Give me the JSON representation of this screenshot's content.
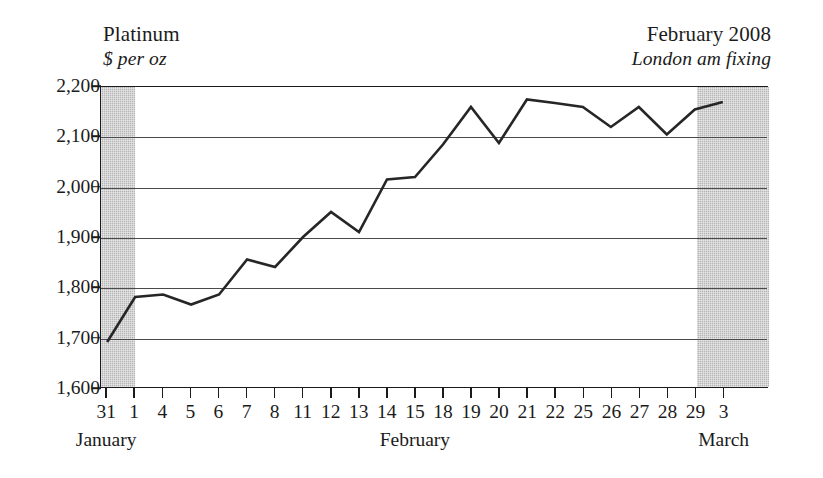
{
  "header": {
    "left_title": "Platinum",
    "left_subtitle": "$ per oz",
    "right_title": "February 2008",
    "right_subtitle": "London am fixing"
  },
  "chart_data": {
    "type": "line",
    "title": "Platinum",
    "subtitle": "$ per oz",
    "annotation_right_title": "February 2008",
    "annotation_right_subtitle": "London am fixing",
    "xlabel": "",
    "ylabel": "$ per oz",
    "grid": true,
    "legend": "none",
    "ylim": [
      1600,
      2200
    ],
    "yticks": [
      1600,
      1700,
      1800,
      1900,
      2000,
      2100,
      2200
    ],
    "ytick_labels": [
      "1,600",
      "1,700",
      "1,800",
      "1,900",
      "2,000",
      "2,100",
      "2,200"
    ],
    "categories": [
      "31",
      "1",
      "4",
      "5",
      "6",
      "7",
      "8",
      "11",
      "12",
      "13",
      "14",
      "15",
      "18",
      "19",
      "20",
      "21",
      "22",
      "25",
      "26",
      "27",
      "28",
      "29",
      "3"
    ],
    "month_groups": [
      {
        "label": "January",
        "start_index": 0,
        "end_index": 0
      },
      {
        "label": "February",
        "start_index": 1,
        "end_index": 21
      },
      {
        "label": "March",
        "start_index": 22,
        "end_index": 22
      }
    ],
    "shaded_bands": [
      {
        "start_index": 0,
        "end_index": 1,
        "color": "#b5b5b5",
        "note": "January month band"
      },
      {
        "start_index": 21,
        "end_index": 22,
        "color": "#b5b5b5",
        "note": "March month band"
      }
    ],
    "values": [
      1690,
      1780,
      1785,
      1765,
      1785,
      1855,
      1840,
      1900,
      1950,
      1910,
      2015,
      2020,
      2085,
      2160,
      2088,
      2175,
      2168,
      2160,
      2120,
      2160,
      2105,
      2155,
      2170
    ],
    "series": [
      {
        "name": "Platinum London am fixing",
        "color": "#262626",
        "values": [
          1690,
          1780,
          1785,
          1765,
          1785,
          1855,
          1840,
          1900,
          1950,
          1910,
          2015,
          2020,
          2085,
          2160,
          2088,
          2175,
          2168,
          2160,
          2120,
          2160,
          2105,
          2155,
          2170
        ]
      }
    ]
  },
  "colors": {
    "line": "#262626",
    "grid": "#4a4a4a",
    "frame": "#1b1b1b",
    "band": "#b5b5b5",
    "background": "#ffffff"
  }
}
